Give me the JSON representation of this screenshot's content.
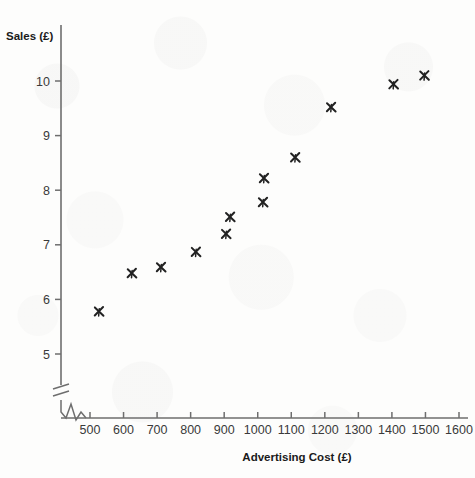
{
  "chart_data": {
    "type": "scatter",
    "title": "",
    "xlabel": "Advertising Cost (£)",
    "ylabel": "Sales (£)",
    "xlim": [
      450,
      1600
    ],
    "ylim": [
      4.6,
      10.6
    ],
    "xticks": [
      500,
      600,
      700,
      800,
      900,
      1000,
      1100,
      1200,
      1300,
      1400,
      1500,
      1600
    ],
    "yticks": [
      5,
      6,
      7,
      8,
      9,
      10
    ],
    "xtick_labels": [
      "500",
      "600",
      "700",
      "800",
      "900",
      "1000",
      "1100",
      "1200",
      "1300",
      "1400",
      "1500",
      "1600"
    ],
    "ytick_labels": [
      "5",
      "6",
      "7",
      "8",
      "9",
      "10"
    ],
    "grid": false,
    "legend": null,
    "axis_break_x": true,
    "axis_break_y": true,
    "marker": "x",
    "marker_color": "#222222",
    "points": [
      {
        "x": 527,
        "y": 5.78
      },
      {
        "x": 625,
        "y": 6.48
      },
      {
        "x": 712,
        "y": 6.59
      },
      {
        "x": 816,
        "y": 6.87
      },
      {
        "x": 906,
        "y": 7.2
      },
      {
        "x": 918,
        "y": 7.51
      },
      {
        "x": 1016,
        "y": 7.78
      },
      {
        "x": 1019,
        "y": 8.22
      },
      {
        "x": 1112,
        "y": 8.6
      },
      {
        "x": 1219,
        "y": 9.52
      },
      {
        "x": 1405,
        "y": 9.94
      },
      {
        "x": 1497,
        "y": 10.1
      }
    ]
  },
  "labels": {
    "y_axis_title": "Sales (£)",
    "x_axis_title": "Advertising Cost (£)"
  },
  "colors": {
    "axis": "#6e6e6e",
    "text": "#1a1a1a",
    "tick_text": "#3a3a3a",
    "marker": "#222222",
    "background": "#fdfdfc"
  }
}
